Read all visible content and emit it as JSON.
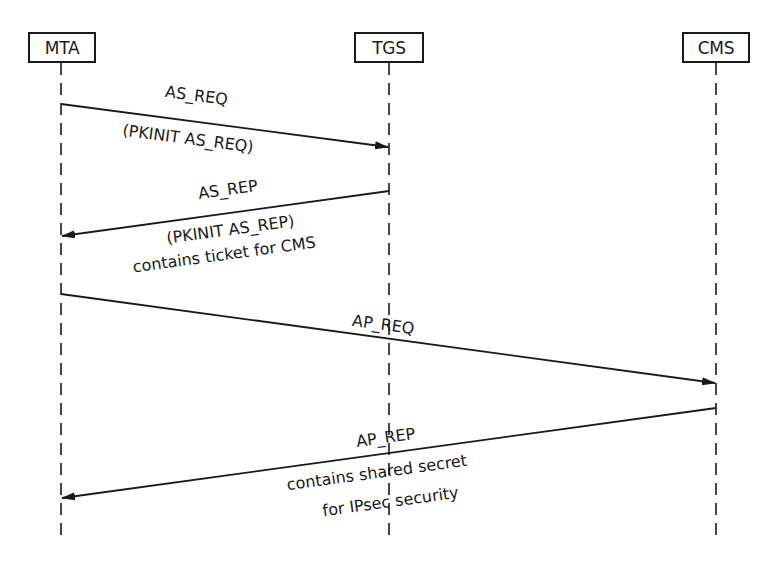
{
  "diagram": {
    "type": "sequence-diagram",
    "actors": [
      {
        "id": "mta",
        "label": "MTA",
        "lifeline_x": 61
      },
      {
        "id": "tgs",
        "label": "TGS",
        "lifeline_x": 389
      },
      {
        "id": "cms",
        "label": "CMS",
        "lifeline_x": 716
      }
    ],
    "messages": [
      {
        "from": "MTA",
        "to": "TGS",
        "name": "AS_REQ",
        "detail": [
          "(PKINIT AS_REQ)"
        ]
      },
      {
        "from": "TGS",
        "to": "MTA",
        "name": "AS_REP",
        "detail": [
          "(PKINIT AS_REP)",
          "contains ticket for CMS"
        ]
      },
      {
        "from": "MTA",
        "to": "CMS",
        "name": "AP_REQ",
        "detail": []
      },
      {
        "from": "CMS",
        "to": "MTA",
        "name": "AP_REP",
        "detail": [
          "contains shared secret",
          "for IPsec security"
        ]
      }
    ],
    "colors": {
      "line": "#1a1a1a",
      "background": "#ffffff"
    }
  }
}
